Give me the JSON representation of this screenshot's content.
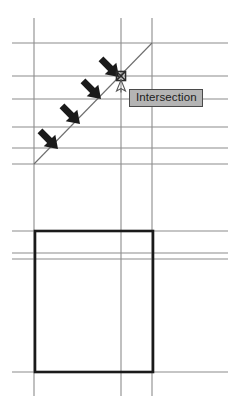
{
  "app": {
    "title": "Intersection Snap",
    "canvas": {
      "width": 234,
      "height": 409,
      "background": "#ffffff"
    }
  },
  "tooltip": {
    "label": "Intersection",
    "background_color": "#b4b4b4",
    "border_color": "#4a4a4a",
    "text_color": "#1c1c1c",
    "x": 129,
    "y": 89
  },
  "snap_marker": {
    "name": "intersection-snap-marker",
    "shape": "square-with-x",
    "x": 121,
    "y": 76,
    "size": 9,
    "color": "#2b2b2b"
  },
  "cursor": {
    "name": "crosshair-cursor",
    "x": 121,
    "y": 79,
    "color": "#555555"
  },
  "geometry": {
    "grid_color": "#8c8c8c",
    "shape_color": "#1a1a1a",
    "diagonal_color": "#6e6e6e",
    "vertical_lines": [
      {
        "id": "v1",
        "x": 34,
        "y1": 18,
        "y2": 396
      },
      {
        "id": "v2",
        "x": 121,
        "y1": 18,
        "y2": 396
      },
      {
        "id": "v3",
        "x": 152,
        "y1": 18,
        "y2": 396
      }
    ],
    "horizontal_lines": [
      {
        "id": "h1",
        "y": 43,
        "x1": 12,
        "x2": 228
      },
      {
        "id": "h2",
        "y": 76,
        "x1": 12,
        "x2": 228
      },
      {
        "id": "h3",
        "y": 99,
        "x1": 12,
        "x2": 228
      },
      {
        "id": "h4",
        "y": 127,
        "x1": 12,
        "x2": 228
      },
      {
        "id": "h5",
        "y": 148,
        "x1": 12,
        "x2": 228
      },
      {
        "id": "h6",
        "y": 164,
        "x1": 12,
        "x2": 228
      },
      {
        "id": "h7",
        "y": 231,
        "x1": 12,
        "x2": 228
      },
      {
        "id": "h8",
        "y": 253,
        "x1": 12,
        "x2": 228
      },
      {
        "id": "h9",
        "y": 259,
        "x1": 12,
        "x2": 228
      },
      {
        "id": "h10",
        "y": 372,
        "x1": 12,
        "x2": 228
      }
    ],
    "diagonal": {
      "id": "d1",
      "x1": 34,
      "y1": 164,
      "x2": 152,
      "y2": 43
    },
    "rectangle": {
      "id": "r1",
      "x": 35,
      "y": 231,
      "width": 118,
      "height": 141
    }
  },
  "annotations": {
    "arrows": [
      {
        "id": "arrow-1",
        "tip_x": 119,
        "tip_y": 77,
        "angle_deg": 45
      },
      {
        "id": "arrow-2",
        "tip_x": 101,
        "tip_y": 99,
        "angle_deg": 45
      },
      {
        "id": "arrow-3",
        "tip_x": 80,
        "tip_y": 124,
        "angle_deg": 45
      },
      {
        "id": "arrow-4",
        "tip_x": 58,
        "tip_y": 149,
        "angle_deg": 45
      }
    ],
    "arrow_color": "#1a1a1a"
  }
}
